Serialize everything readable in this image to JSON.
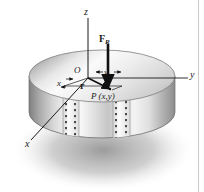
{
  "figure": {
    "background_color": "#ffffff",
    "width": 204,
    "height": 192,
    "axes": {
      "z_label": "z",
      "y_label": "y",
      "x_label": "x",
      "origin_label": "O"
    },
    "coordinate_dims": {
      "x_dim_label": "x",
      "y_dim_label": "y"
    },
    "vectors": {
      "force_label": "F",
      "force_subscript": "R",
      "position_label": "r"
    },
    "point": {
      "label": "P (x,y)"
    },
    "colors": {
      "line": "#1a1a1a",
      "cylinder_light": "#f2f2f2",
      "cylinder_mid": "#cfcfcf",
      "cylinder_dark": "#8e8e8e",
      "shadow": "#9a9a9a",
      "border_rule": "#c9c9c9"
    }
  }
}
